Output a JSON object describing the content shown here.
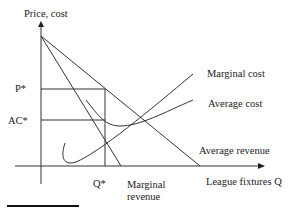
{
  "labels": {
    "y_axis": "Price, cost",
    "x_axis": "League fixtures Q",
    "p_star": "P*",
    "ac_star": "AC*",
    "q_star": "Q*",
    "marginal_cost": "Marginal cost",
    "average_cost": "Average cost",
    "average_revenue": "Average revenue",
    "marginal_revenue_1": "Marginal",
    "marginal_revenue_2": "revenue"
  },
  "colors": {
    "line": "#333333",
    "text": "#222222"
  }
}
